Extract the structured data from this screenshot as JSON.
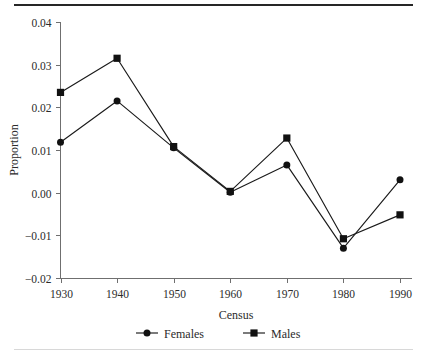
{
  "chart_data": {
    "type": "line",
    "title": "",
    "xlabel": "Census",
    "ylabel": "Proportion",
    "categories": [
      "1930",
      "1940",
      "1950",
      "1960",
      "1970",
      "1980",
      "1990"
    ],
    "x": [
      1930,
      1940,
      1950,
      1960,
      1970,
      1980,
      1990
    ],
    "xlim": [
      1925,
      1995
    ],
    "ylim": [
      -0.02,
      0.04
    ],
    "yticks": [
      0.04,
      0.03,
      0.02,
      0.01,
      0.0,
      -0.01,
      -0.02
    ],
    "ytick_labels": [
      "0.04",
      "0.03",
      "0.02",
      "0.01",
      "0.00",
      "−0.01",
      "−0.02"
    ],
    "xticks": [
      1930,
      1940,
      1950,
      1960,
      1970,
      1980,
      1990
    ],
    "xtick_labels": [
      "1930",
      "1940",
      "1950",
      "1960",
      "1970",
      "1980",
      "1990"
    ],
    "grid": false,
    "legend_position": "bottom-center",
    "series": [
      {
        "name": "Females",
        "marker": "circle",
        "color": "#111111",
        "values": [
          0.0118,
          0.0215,
          0.0105,
          0.0001,
          0.0065,
          -0.013,
          0.003
        ]
      },
      {
        "name": "Males",
        "marker": "square",
        "color": "#111111",
        "values": [
          0.0235,
          0.0315,
          0.0108,
          0.0003,
          0.0128,
          -0.0108,
          -0.0052
        ]
      }
    ]
  },
  "legend": {
    "items": [
      {
        "label": "Females",
        "marker": "circle"
      },
      {
        "label": "Males",
        "marker": "square"
      }
    ]
  },
  "axes": {
    "y_title": "Proportion",
    "x_title": "Census"
  },
  "colors": {
    "ink": "#111111",
    "axis": "#6f6f6f",
    "rule_top": "#262626",
    "rule_bottom": "#d8d8d8",
    "background": "#ffffff"
  }
}
